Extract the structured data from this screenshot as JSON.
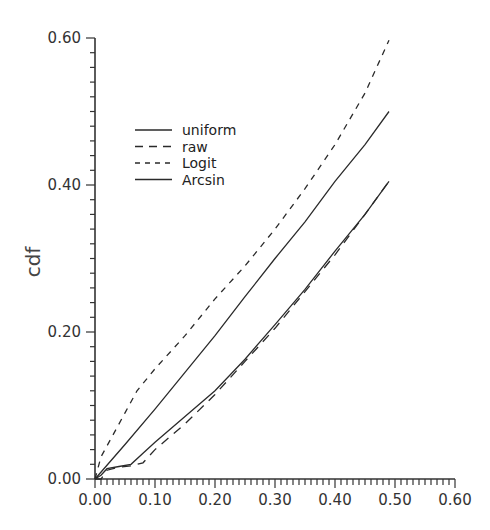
{
  "chart_data": {
    "type": "line",
    "title": "",
    "xlabel": "",
    "ylabel": "cdf",
    "xlim": [
      0.0,
      0.6
    ],
    "ylim": [
      0.0,
      0.6
    ],
    "x_ticks": [
      "0.00",
      "0.10",
      "0.20",
      "0.30",
      "0.40",
      "0.50",
      "0.60"
    ],
    "y_ticks": [
      "0.00",
      "0.20",
      "0.40",
      "0.60"
    ],
    "grid": false,
    "legend_position": "upper-left-inside",
    "series": [
      {
        "name": "uniform",
        "style": "solid",
        "x": [
          0.0,
          0.05,
          0.1,
          0.15,
          0.2,
          0.25,
          0.3,
          0.35,
          0.4,
          0.45,
          0.49
        ],
        "y": [
          0.0,
          0.047,
          0.095,
          0.145,
          0.195,
          0.248,
          0.3,
          0.35,
          0.405,
          0.455,
          0.5
        ]
      },
      {
        "name": "raw",
        "style": "long-dash",
        "x": [
          0.0,
          0.01,
          0.02,
          0.04,
          0.06,
          0.08,
          0.1,
          0.15,
          0.2,
          0.25,
          0.3,
          0.35,
          0.4,
          0.45,
          0.49
        ],
        "y": [
          0.0,
          0.0,
          0.012,
          0.016,
          0.018,
          0.022,
          0.04,
          0.075,
          0.115,
          0.16,
          0.205,
          0.255,
          0.305,
          0.36,
          0.405
        ]
      },
      {
        "name": "Logit",
        "style": "short-dash",
        "x": [
          0.0,
          0.01,
          0.03,
          0.05,
          0.07,
          0.1,
          0.15,
          0.2,
          0.25,
          0.3,
          0.35,
          0.4,
          0.45,
          0.49
        ],
        "y": [
          0.0,
          0.03,
          0.06,
          0.09,
          0.12,
          0.15,
          0.195,
          0.245,
          0.29,
          0.34,
          0.395,
          0.455,
          0.525,
          0.597
        ]
      },
      {
        "name": "Arcsin",
        "style": "solid",
        "x": [
          0.0,
          0.01,
          0.02,
          0.04,
          0.06,
          0.08,
          0.1,
          0.15,
          0.2,
          0.25,
          0.3,
          0.35,
          0.4,
          0.45,
          0.49
        ],
        "y": [
          0.0,
          0.005,
          0.014,
          0.017,
          0.02,
          0.035,
          0.05,
          0.085,
          0.12,
          0.163,
          0.21,
          0.258,
          0.31,
          0.36,
          0.405
        ]
      }
    ]
  }
}
